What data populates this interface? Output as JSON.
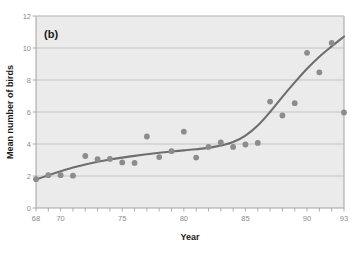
{
  "chart_data": {
    "type": "scatter",
    "title": "",
    "panel_label": "(b)",
    "xlabel": "Year",
    "ylabel": "Mean number of birds",
    "xlim": [
      68,
      93
    ],
    "ylim": [
      0,
      12
    ],
    "xticks": [
      68,
      69,
      70,
      71,
      72,
      73,
      74,
      75,
      76,
      77,
      78,
      79,
      80,
      81,
      82,
      83,
      84,
      85,
      86,
      87,
      88,
      89,
      90,
      91,
      92,
      93
    ],
    "xtick_labels": [
      "68",
      "",
      "70",
      "",
      "",
      "",
      "",
      "75",
      "",
      "",
      "",
      "",
      "80",
      "",
      "",
      "",
      "",
      "85",
      "",
      "",
      "",
      "",
      "90",
      "",
      "",
      "93"
    ],
    "yticks": [
      0,
      2,
      4,
      6,
      8,
      10,
      12
    ],
    "ytick_labels": [
      "0",
      "2",
      "4",
      "6",
      "8",
      "10",
      "12"
    ],
    "grid": "horizontal",
    "legend": "none",
    "plot_background": "#ebebeb",
    "point_color": "#8c8c8c",
    "line_color": "#6e6e6e",
    "gridline_color": "#b9b9b9",
    "series": [
      {
        "name": "Mean number of birds",
        "marker": "circle",
        "points": [
          {
            "x": 68,
            "y": 1.8
          },
          {
            "x": 69,
            "y": 2.05
          },
          {
            "x": 70,
            "y": 2.05
          },
          {
            "x": 71,
            "y": 2.02
          },
          {
            "x": 72,
            "y": 3.25
          },
          {
            "x": 73,
            "y": 3.05
          },
          {
            "x": 74,
            "y": 3.07
          },
          {
            "x": 75,
            "y": 2.85
          },
          {
            "x": 76,
            "y": 2.82
          },
          {
            "x": 77,
            "y": 4.47
          },
          {
            "x": 78,
            "y": 3.18
          },
          {
            "x": 79,
            "y": 3.55
          },
          {
            "x": 80,
            "y": 4.77
          },
          {
            "x": 81,
            "y": 3.15
          },
          {
            "x": 82,
            "y": 3.82
          },
          {
            "x": 83,
            "y": 4.1
          },
          {
            "x": 84,
            "y": 3.82
          },
          {
            "x": 85,
            "y": 3.97
          },
          {
            "x": 86,
            "y": 4.07
          },
          {
            "x": 87,
            "y": 6.65
          },
          {
            "x": 88,
            "y": 5.78
          },
          {
            "x": 89,
            "y": 6.55
          },
          {
            "x": 90,
            "y": 9.7
          },
          {
            "x": 91,
            "y": 8.48
          },
          {
            "x": 92,
            "y": 10.32
          },
          {
            "x": 93,
            "y": 5.97
          }
        ]
      },
      {
        "name": "smoothed trend",
        "marker": "none",
        "style": "line",
        "points": [
          {
            "x": 68.0,
            "y": 1.78
          },
          {
            "x": 69.0,
            "y": 2.05
          },
          {
            "x": 70.0,
            "y": 2.3
          },
          {
            "x": 71.0,
            "y": 2.53
          },
          {
            "x": 72.0,
            "y": 2.72
          },
          {
            "x": 73.0,
            "y": 2.89
          },
          {
            "x": 74.0,
            "y": 3.03
          },
          {
            "x": 75.0,
            "y": 3.15
          },
          {
            "x": 76.0,
            "y": 3.26
          },
          {
            "x": 77.0,
            "y": 3.36
          },
          {
            "x": 78.0,
            "y": 3.45
          },
          {
            "x": 79.0,
            "y": 3.53
          },
          {
            "x": 80.0,
            "y": 3.6
          },
          {
            "x": 81.0,
            "y": 3.67
          },
          {
            "x": 82.0,
            "y": 3.76
          },
          {
            "x": 83.0,
            "y": 3.9
          },
          {
            "x": 84.0,
            "y": 4.12
          },
          {
            "x": 85.0,
            "y": 4.52
          },
          {
            "x": 86.0,
            "y": 5.15
          },
          {
            "x": 87.0,
            "y": 6.0
          },
          {
            "x": 88.0,
            "y": 6.95
          },
          {
            "x": 89.0,
            "y": 7.85
          },
          {
            "x": 90.0,
            "y": 8.7
          },
          {
            "x": 91.0,
            "y": 9.45
          },
          {
            "x": 92.0,
            "y": 10.1
          },
          {
            "x": 93.0,
            "y": 10.72
          }
        ]
      }
    ]
  }
}
